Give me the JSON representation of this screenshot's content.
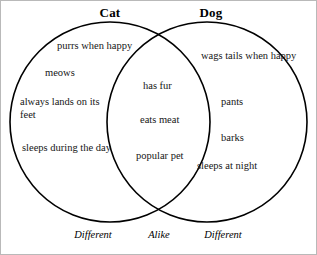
{
  "diagram": {
    "type": "venn",
    "left_heading": "Cat",
    "right_heading": "Dog",
    "stroke_color": "#000000",
    "frame_color": "#b9b9b9",
    "background_color": "#ffffff",
    "left_only_items": [
      "purrs when happy",
      "meows",
      "always lands on its feet",
      "sleeps during the day"
    ],
    "shared_items": [
      "has fur",
      "eats meat",
      "popular pet"
    ],
    "right_only_items": [
      "wags tails when happy",
      "pants",
      "barks",
      "sleeps at night"
    ],
    "bottom_labels": [
      "Different",
      "Alike",
      "Different"
    ]
  }
}
